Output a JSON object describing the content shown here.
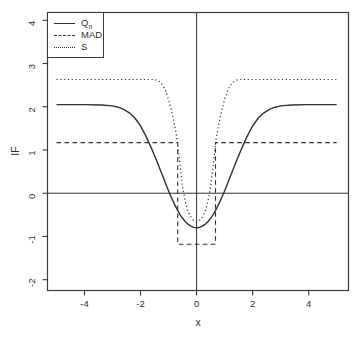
{
  "legend": {
    "items": [
      {
        "label": "Q",
        "sub": "n",
        "line_style": "solid"
      },
      {
        "label": "MAD",
        "sub": "",
        "line_style": "dashed"
      },
      {
        "label": "S",
        "sub": "",
        "line_style": "dotted"
      }
    ]
  },
  "chart_data": {
    "type": "line",
    "title": "",
    "xlabel": "x",
    "ylabel": "IF",
    "xlim": [
      -5.32,
      5.42
    ],
    "ylim": [
      -2.25,
      4.18
    ],
    "x_ticks": [
      -4,
      -2,
      0,
      2,
      4
    ],
    "y_ticks": [
      -2,
      -1,
      0,
      1,
      2,
      3,
      4
    ],
    "grid": false,
    "legend_position": "top-left",
    "line_color": "#303030",
    "box_color": "#3a3a3a",
    "reference_lines": {
      "horizontal_at": 0,
      "vertical_at": 0
    },
    "series": [
      {
        "name": "Qn",
        "style": "solid",
        "x": [
          -5,
          -4.5,
          -4,
          -3.4,
          -3,
          -2.8,
          -2.6,
          -2.4,
          -2.2,
          -2,
          -1.8,
          -1.6,
          -1.4,
          -1.2,
          -1,
          -0.9,
          -0.8,
          -0.7,
          -0.6,
          -0.5,
          -0.4,
          -0.3,
          -0.2,
          -0.1,
          0,
          0.1,
          0.2,
          0.3,
          0.4,
          0.5,
          0.6,
          0.7,
          0.8,
          0.9,
          1,
          1.2,
          1.4,
          1.6,
          1.8,
          2,
          2.2,
          2.4,
          2.6,
          2.8,
          3,
          3.4,
          4,
          4.5,
          5
        ],
        "y": [
          2.05,
          2.05,
          2.05,
          2.04,
          2.02,
          1.99,
          1.94,
          1.86,
          1.74,
          1.56,
          1.31,
          1.02,
          0.71,
          0.38,
          0.05,
          -0.1,
          -0.24,
          -0.37,
          -0.49,
          -0.58,
          -0.66,
          -0.72,
          -0.76,
          -0.79,
          -0.8,
          -0.79,
          -0.76,
          -0.72,
          -0.66,
          -0.58,
          -0.49,
          -0.37,
          -0.24,
          -0.1,
          0.05,
          0.38,
          0.71,
          1.02,
          1.31,
          1.56,
          1.74,
          1.86,
          1.94,
          1.99,
          2.02,
          2.04,
          2.05,
          2.05,
          2.05
        ]
      },
      {
        "name": "MAD",
        "style": "dashed",
        "x": [
          -5,
          -0.674,
          -0.674,
          0.674,
          0.674,
          5
        ],
        "y": [
          1.17,
          1.17,
          -1.18,
          -1.18,
          1.17,
          1.17
        ]
      },
      {
        "name": "S",
        "style": "dotted",
        "x": [
          -5,
          -4,
          -3,
          -2,
          -1.7,
          -1.5,
          -1.4,
          -1.3,
          -1.2,
          -1.1,
          -1,
          -0.95,
          -0.9,
          -0.85,
          -0.8,
          -0.75,
          -0.7,
          -0.65,
          -0.6,
          -0.55,
          -0.5,
          -0.45,
          -0.4,
          -0.35,
          -0.3,
          -0.25,
          -0.2,
          -0.15,
          -0.1,
          -0.05,
          0,
          0.05,
          0.1,
          0.15,
          0.2,
          0.25,
          0.3,
          0.35,
          0.4,
          0.45,
          0.5,
          0.55,
          0.6,
          0.65,
          0.7,
          0.75,
          0.8,
          0.85,
          0.9,
          0.95,
          1,
          1.1,
          1.2,
          1.3,
          1.4,
          1.5,
          1.7,
          2,
          3,
          4,
          5
        ],
        "y": [
          2.63,
          2.63,
          2.63,
          2.63,
          2.63,
          2.63,
          2.61,
          2.57,
          2.49,
          2.36,
          2.16,
          2.05,
          1.92,
          1.78,
          1.62,
          1.45,
          1.25,
          0.98,
          0.7,
          0.42,
          0.15,
          -0.03,
          -0.2,
          -0.32,
          -0.43,
          -0.5,
          -0.55,
          -0.6,
          -0.63,
          -0.655,
          -0.66,
          -0.655,
          -0.63,
          -0.6,
          -0.55,
          -0.5,
          -0.43,
          -0.32,
          -0.2,
          -0.03,
          0.15,
          0.42,
          0.7,
          0.98,
          1.25,
          1.45,
          1.62,
          1.78,
          1.92,
          2.05,
          2.16,
          2.36,
          2.49,
          2.57,
          2.61,
          2.63,
          2.63,
          2.63,
          2.63,
          2.63,
          2.63
        ]
      }
    ]
  }
}
